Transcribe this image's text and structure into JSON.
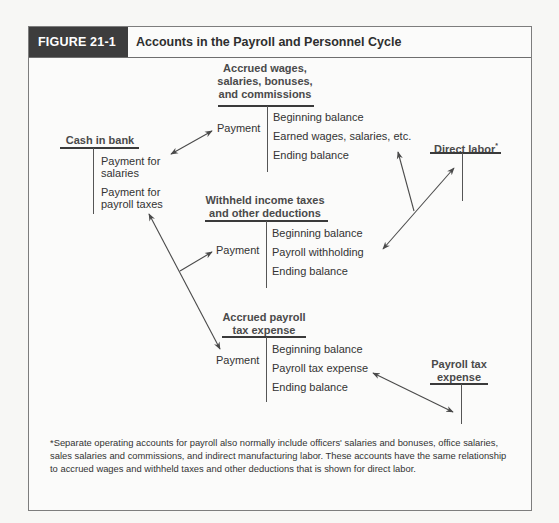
{
  "figure": {
    "label": "FIGURE 21-1",
    "title": "Accounts in the Payroll and Personnel Cycle"
  },
  "accounts": {
    "cash_in_bank": {
      "title": "Cash in bank",
      "credits": [
        "Payment for",
        "salaries",
        "Payment for",
        "payroll taxes"
      ]
    },
    "accrued_wages": {
      "title_lines": [
        "Accrued wages,",
        "salaries, bonuses,",
        "and commissions"
      ],
      "debit": "Payment",
      "credits": [
        "Beginning balance",
        "Earned wages, salaries, etc.",
        "Ending balance"
      ]
    },
    "direct_labor": {
      "title": "Direct labor",
      "footnote_mark": "*"
    },
    "withheld_taxes": {
      "title_lines": [
        "Withheld income taxes",
        "and other deductions"
      ],
      "debit": "Payment",
      "credits": [
        "Beginning balance",
        "Payroll withholding",
        "Ending balance"
      ]
    },
    "accrued_payroll_tax": {
      "title_lines": [
        "Accrued payroll",
        "tax expense"
      ],
      "debit": "Payment",
      "credits": [
        "Beginning balance",
        "Payroll tax expense",
        "Ending balance"
      ]
    },
    "payroll_tax_expense": {
      "title_lines": [
        "Payroll tax",
        "expense"
      ]
    }
  },
  "footnote": "*Separate operating accounts for payroll also normally include officers' salaries and bonuses, office salaries, sales salaries and commissions, and indirect manufacturing labor. These accounts have the same relationship to accrued wages and withheld taxes and other deductions that is shown for direct labor.",
  "colors": {
    "header_label_bg": "#3d3d3d",
    "line": "#3a3a3a",
    "arrow": "#4a4a4a"
  }
}
